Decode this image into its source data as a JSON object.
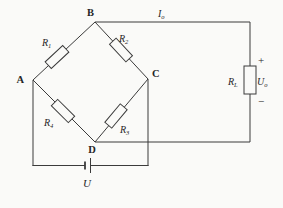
{
  "circuit": {
    "nodes": {
      "a": "A",
      "b": "B",
      "c": "C",
      "d": "D"
    },
    "bridge_resistors": {
      "r1": {
        "symbol": "R",
        "subscript": "1"
      },
      "r2": {
        "symbol": "R",
        "subscript": "2"
      },
      "r3": {
        "symbol": "R",
        "subscript": "3"
      },
      "r4": {
        "symbol": "R",
        "subscript": "4"
      }
    },
    "load_branch": {
      "resistor": {
        "symbol": "R",
        "subscript": "L"
      },
      "output_current": {
        "symbol": "I",
        "subscript": "o"
      },
      "output_voltage": {
        "symbol": "U",
        "subscript": "o"
      },
      "polarity_plus": "+",
      "polarity_minus": "−"
    },
    "supply": {
      "label": "U"
    }
  },
  "colors": {
    "wire": "#3b3b3b",
    "background": "#fafaf8",
    "text": "#262626"
  }
}
